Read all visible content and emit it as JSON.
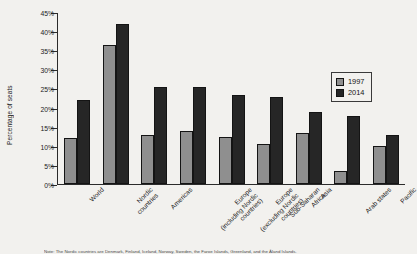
{
  "axis": {
    "ylabel": "Percentage of seats",
    "yticks": [
      "0%",
      "5%",
      "10%",
      "15%",
      "20%",
      "25%",
      "30%",
      "35%",
      "40%",
      "45%"
    ]
  },
  "legend": {
    "items": [
      {
        "label": "1997",
        "color": "#8f8f8f"
      },
      {
        "label": "2014",
        "color": "#262626"
      }
    ]
  },
  "note": {
    "text": "Note: The Nordic countries are Denmark, Finland, Iceland, Norway, Sweden, the Faroe Islands, Greenland, and the Åland Islands."
  },
  "categories": [
    "World",
    "Nordic\ncountries",
    "Americas",
    "Europe\n(including Nordic\ncountries)",
    "Europe\n(excluding Nordic\ncountries)",
    "Sub-Saharan\nAfrica",
    "Asia",
    "Arab states",
    "Pacific"
  ],
  "chart_data": {
    "type": "bar",
    "title": "",
    "xlabel": "",
    "ylabel": "Percentage of seats",
    "ylim": [
      0,
      45
    ],
    "ytick_step": 5,
    "grid": false,
    "legend_position": "upper-right",
    "categories": [
      "World",
      "Nordic countries",
      "Americas",
      "Europe (including Nordic countries)",
      "Europe (excluding Nordic countries)",
      "Sub-Saharan Africa",
      "Asia",
      "Arab states",
      "Pacific"
    ],
    "series": [
      {
        "name": "1997",
        "color": "#8f8f8f",
        "values": [
          12,
          36.5,
          13,
          14,
          12.5,
          10.5,
          13.5,
          3.5,
          10
        ]
      },
      {
        "name": "2014",
        "color": "#262626",
        "values": [
          22,
          42,
          25.5,
          25.5,
          23.5,
          23,
          19,
          18,
          13
        ]
      }
    ]
  }
}
